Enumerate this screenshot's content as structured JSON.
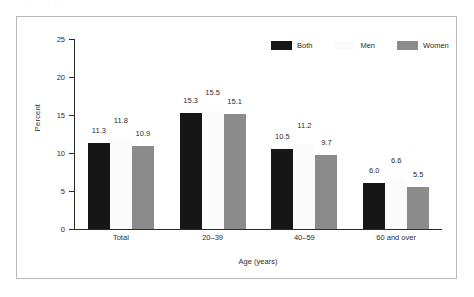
{
  "scan": {
    "top_sliver_text": "· · · · · · ·"
  },
  "chart_data": {
    "type": "bar",
    "title": "",
    "subtitle": "",
    "xlabel": "Age (years)",
    "ylabel": "Percent",
    "categories": [
      "Total",
      "20–39",
      "40–59",
      "60 and over"
    ],
    "series": [
      {
        "name": "Both",
        "color": "#161616",
        "values": [
          11.3,
          15.3,
          10.5,
          6.0
        ]
      },
      {
        "name": "Men",
        "color": "#fbfbfb",
        "values": [
          11.8,
          15.5,
          11.2,
          6.6
        ]
      },
      {
        "name": "Women",
        "color": "#8b8b8b",
        "values": [
          10.9,
          15.1,
          9.7,
          5.5
        ]
      }
    ],
    "value_labels": [
      [
        "11.3",
        "11.8",
        "10.9"
      ],
      [
        "15.3",
        "15.5",
        "15.1"
      ],
      [
        "10.5",
        "11.2",
        "9.7"
      ],
      [
        "6.0",
        "6.6",
        "5.5"
      ]
    ],
    "ylim": [
      0,
      25
    ],
    "yticks": [
      0,
      5,
      10,
      15,
      20,
      25
    ],
    "ytick_labels": [
      "0",
      "5",
      "10",
      "15",
      "20",
      "25"
    ],
    "grid": false,
    "legend_position": "top-right",
    "legend": [
      "Both",
      "Men",
      "Women"
    ]
  }
}
